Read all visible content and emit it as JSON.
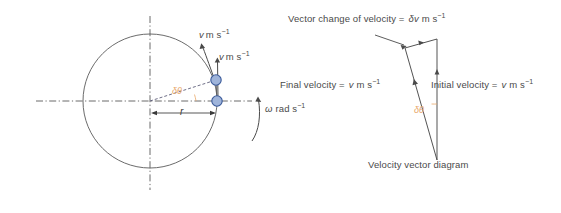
{
  "figure": {
    "title_caption": "Velocity vector diagram",
    "colors": {
      "line": "#555555",
      "particle_fill": "#9fb4da",
      "particle_stroke": "#3a5a9a",
      "angle_label": "#e8a86a",
      "text": "#4a4a4a",
      "background": "#ffffff"
    }
  },
  "left_diagram": {
    "name": "circular-motion-diagram",
    "tangential_velocity_top": {
      "symbol": "v",
      "unit": "m s",
      "exponent": "−1"
    },
    "tangential_velocity_right": {
      "symbol": "v",
      "unit": "m s",
      "exponent": "−1"
    },
    "angle_label": "δθ",
    "radius_label": "r",
    "angular_velocity": {
      "symbol": "ω",
      "unit": "rad s",
      "exponent": "−1"
    }
  },
  "right_diagram": {
    "name": "velocity-vector-triangle",
    "vector_change_label": "Vector change of velocity =",
    "vector_change_symbol": "δv",
    "vector_change_unit": "m s",
    "vector_change_exponent": "−1",
    "final_velocity_label": "Final velocity =",
    "final_velocity_symbol": "v",
    "final_velocity_unit": "m s",
    "final_velocity_exponent": "−1",
    "initial_velocity_label": "Initial velocity =",
    "initial_velocity_symbol": "v",
    "initial_velocity_unit": "m s",
    "initial_velocity_exponent": "−1",
    "angle_label": "δθ",
    "caption": "Velocity vector diagram"
  }
}
